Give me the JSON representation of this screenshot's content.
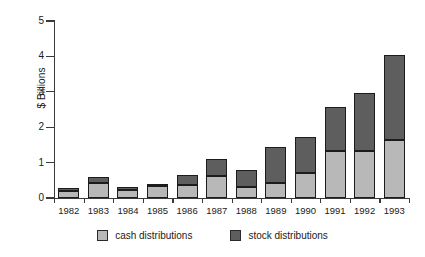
{
  "chart_data": {
    "type": "bar",
    "subtype": "stacked-vertical",
    "title": "",
    "xlabel": "",
    "ylabel": "$ Billions",
    "ylim": [
      0,
      5
    ],
    "yticks": [
      0,
      1,
      2,
      3,
      4,
      5
    ],
    "ytick_labels": [
      "0",
      "1",
      "2",
      "3",
      "4",
      "5"
    ],
    "grid": false,
    "legend_position": "bottom-center",
    "categories": [
      "1982",
      "1983",
      "1984",
      "1985",
      "1986",
      "1987",
      "1988",
      "1989",
      "1990",
      "1991",
      "1992",
      "1993"
    ],
    "series": [
      {
        "name": "cash distributions",
        "color": "#b8b8b8",
        "values": [
          0.2,
          0.43,
          0.22,
          0.33,
          0.36,
          0.62,
          0.3,
          0.42,
          0.72,
          1.33,
          1.34,
          1.63
        ]
      },
      {
        "name": "stock distributions",
        "color": "#5e5e5e",
        "values": [
          0.08,
          0.17,
          0.09,
          0.08,
          0.3,
          0.48,
          0.5,
          1.01,
          0.99,
          1.24,
          1.63,
          2.42
        ]
      }
    ],
    "totals": [
      0.28,
      0.6,
      0.31,
      0.41,
      0.66,
      1.1,
      0.8,
      1.43,
      1.71,
      2.57,
      2.97,
      4.05
    ]
  },
  "axis": {
    "y_title": "$ Billions"
  },
  "legend": {
    "items": [
      {
        "label": "cash distributions",
        "swatch_name": "legend-swatch-cash"
      },
      {
        "label": "stock distributions",
        "swatch_name": "legend-swatch-stock"
      }
    ]
  }
}
